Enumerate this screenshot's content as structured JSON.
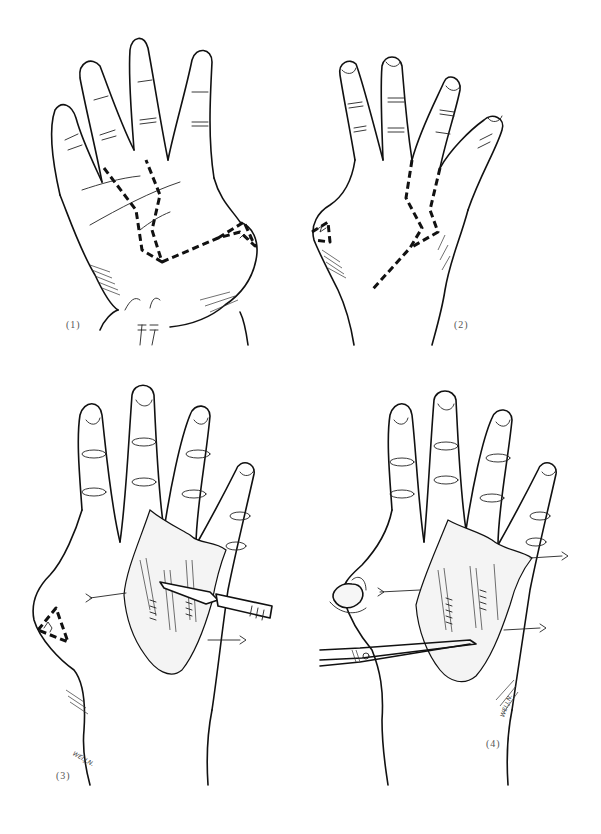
{
  "figure": {
    "type": "surgical line illustration",
    "colors": {
      "ink": "#111111",
      "background": "#ffffff"
    },
    "panels": [
      {
        "id": 1,
        "label": "(1)",
        "view": "palmar hand with dashed zig-zag incision lines and thenar triangle marking"
      },
      {
        "id": 2,
        "label": "(2)",
        "view": "dorsal hand with dashed zig-zag incision lines between fingers"
      },
      {
        "id": 3,
        "label": "(3)",
        "view": "incision opened with retraction sutures, scalpel dissecting",
        "signature": "WEI.J.N."
      },
      {
        "id": 4,
        "label": "(4)",
        "view": "exposed tendons with retraction sutures, scissors in wound, excised nodule on thumb side",
        "signature": "WEI.J.N."
      }
    ]
  }
}
